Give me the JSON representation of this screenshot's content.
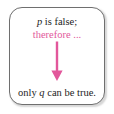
{
  "figure": {
    "background_color": "#ffffff",
    "box": {
      "border_color": "#6f6f6f",
      "fill_color": "#ffffff",
      "corner_radius_px": 13
    },
    "premise": {
      "variable": "p",
      "text_after": " is false;"
    },
    "connector": {
      "text": "therefore ...",
      "color": "#e2579b"
    },
    "arrow": {
      "direction": "down",
      "color": "#e2579b",
      "icon": "down-arrow-icon"
    },
    "conclusion": {
      "text_before": "only ",
      "variable": "q",
      "text_after": " can be true."
    }
  }
}
